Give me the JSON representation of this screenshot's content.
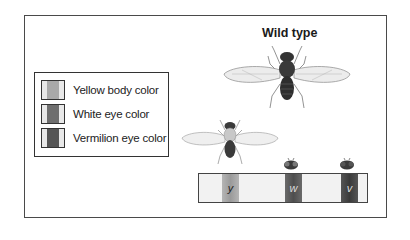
{
  "title": "Wild type",
  "legend": {
    "items": [
      {
        "label": "Yellow body color",
        "color": "#a9a9a9"
      },
      {
        "label": "White eye color",
        "color": "#6e6e6e"
      },
      {
        "label": "Vermilion eye color",
        "color": "#555555"
      }
    ]
  },
  "chromosome": {
    "bands": [
      {
        "label": "y",
        "color": "#a9a9a9"
      },
      {
        "label": "w",
        "color": "#5e5e5e"
      },
      {
        "label": "v",
        "color": "#4a4a4a"
      }
    ]
  },
  "figures": {
    "wild_type_fly": "wild-type fruit fly",
    "yellow_fly": "yellow-body mutant fly",
    "white_eye_head": "white-eye head",
    "vermilion_eye_head": "vermilion-eye head"
  }
}
